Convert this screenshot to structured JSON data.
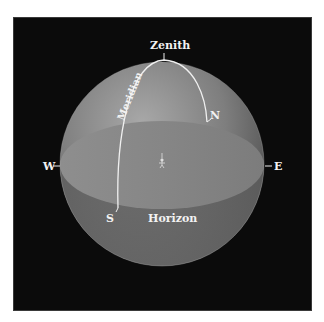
{
  "diagram": {
    "labels": {
      "zenith": "Zenith",
      "meridian": "Meridian",
      "north": "N",
      "south": "S",
      "east": "E",
      "west": "W",
      "horizon": "Horizon"
    },
    "colors": {
      "background": "#0b0b0b",
      "sphere_light": "#9a9a9a",
      "sphere_dark": "#4a4a4a",
      "horizon_plane": "#8c8c8c",
      "line": "#f0f0f0",
      "text": "#f2f2f2"
    }
  }
}
